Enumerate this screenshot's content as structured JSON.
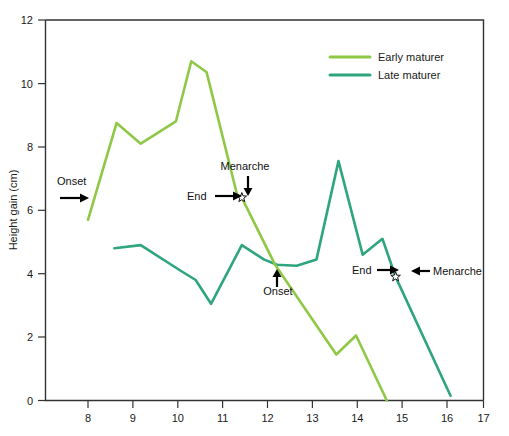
{
  "chart_data": {
    "type": "line",
    "title": "",
    "xlabel": "",
    "ylabel": "Height gain (cm)",
    "xlim": [
      7.3,
      17
    ],
    "ylim": [
      0,
      12
    ],
    "x_ticks": [
      8,
      9,
      10,
      11,
      12,
      13,
      14,
      15,
      16,
      17
    ],
    "y_ticks": [
      0,
      2,
      4,
      6,
      8,
      10,
      12
    ],
    "grid": false,
    "legend_position": "top-right",
    "series": [
      {
        "name": "Early maturer",
        "color": "#8FC846",
        "points": [
          [
            8.0,
            5.7
          ],
          [
            8.65,
            8.75
          ],
          [
            9.2,
            8.1
          ],
          [
            10.0,
            8.8
          ],
          [
            10.35,
            10.7
          ],
          [
            10.7,
            10.35
          ],
          [
            11.4,
            6.45
          ],
          [
            11.5,
            6.4
          ],
          [
            12.25,
            4.3
          ],
          [
            13.65,
            1.45
          ],
          [
            14.1,
            2.05
          ],
          [
            14.8,
            0.0
          ]
        ]
      },
      {
        "name": "Late maturer",
        "color": "#2FA57F",
        "points": [
          [
            8.6,
            4.8
          ],
          [
            9.2,
            4.9
          ],
          [
            10.1,
            4.1
          ],
          [
            10.45,
            3.8
          ],
          [
            10.8,
            3.05
          ],
          [
            11.5,
            4.9
          ],
          [
            12.0,
            4.45
          ],
          [
            12.3,
            4.28
          ],
          [
            12.75,
            4.25
          ],
          [
            13.2,
            4.45
          ],
          [
            13.7,
            7.55
          ],
          [
            14.25,
            4.6
          ],
          [
            14.7,
            5.1
          ],
          [
            15.0,
            3.9
          ],
          [
            16.25,
            0.15
          ]
        ]
      }
    ],
    "annotations": [
      {
        "id": "early-onset",
        "label": "Onset",
        "series": "Early maturer",
        "arrow": "right",
        "x": 8.05,
        "y": 6.3
      },
      {
        "id": "early-end",
        "label": "End",
        "series": "Early maturer",
        "arrow": "right",
        "x": 11.4,
        "y": 6.45
      },
      {
        "id": "early-menarche",
        "label": "Menarche",
        "series": "Early maturer",
        "arrow": "down",
        "x": 11.5,
        "y": 6.4
      },
      {
        "id": "late-onset",
        "label": "Onset",
        "series": "Late maturer",
        "arrow": "up",
        "x": 12.3,
        "y": 4.28
      },
      {
        "id": "late-end",
        "label": "End",
        "series": "Late maturer",
        "arrow": "right",
        "x": 14.8,
        "y": 4.3
      },
      {
        "id": "late-menarche",
        "label": "Menarche",
        "series": "Late maturer",
        "arrow": "left",
        "x": 15.0,
        "y": 3.9
      }
    ],
    "markers": [
      {
        "id": "early-menarche-star",
        "shape": "star",
        "x": 11.5,
        "y": 6.4
      },
      {
        "id": "late-menarche-star",
        "shape": "star",
        "x": 15.0,
        "y": 3.9
      }
    ]
  },
  "axis": {
    "y_title": "Height gain (cm)",
    "y_tick_labels": [
      "0",
      "2",
      "4",
      "6",
      "8",
      "10",
      "12"
    ],
    "x_tick_labels": [
      "8",
      "9",
      "10",
      "11",
      "12",
      "13",
      "14",
      "15",
      "16",
      "17"
    ]
  },
  "legend": {
    "items": [
      {
        "label": "Early maturer",
        "color": "#8FC846"
      },
      {
        "label": "Late maturer",
        "color": "#2FA57F"
      }
    ]
  },
  "annotation_labels": {
    "early_onset": "Onset",
    "early_end": "End",
    "early_menarche": "Menarche",
    "late_onset": "Onset",
    "late_end": "End",
    "late_menarche": "Menarche"
  },
  "colors": {
    "early": "#8FC846",
    "late": "#2FA57F",
    "axis": "#333333",
    "text": "#1a1a1a",
    "background": "#ffffff"
  }
}
